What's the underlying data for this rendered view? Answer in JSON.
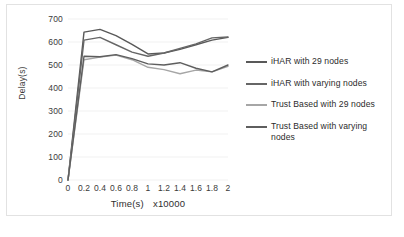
{
  "chart_data": {
    "type": "line",
    "title": "",
    "xlabel": "Time(s)",
    "xunit": "x10000",
    "ylabel": "Delay(s)",
    "xlim": [
      0,
      2
    ],
    "ylim": [
      0,
      700
    ],
    "grid": true,
    "legend_position": "right",
    "x": [
      0,
      0.2,
      0.4,
      0.6,
      0.8,
      1,
      1.2,
      1.4,
      1.6,
      1.8,
      2
    ],
    "xticklabels": [
      "0",
      "0.2",
      "0.4",
      "0.6",
      "0.8",
      "1",
      "1.2",
      "1.4",
      "1.6",
      "1.8",
      "2"
    ],
    "yticklabels": [
      "0",
      "100",
      "200",
      "300",
      "400",
      "500",
      "600",
      "700"
    ],
    "yticks": [
      0,
      100,
      200,
      300,
      400,
      500,
      600,
      700
    ],
    "series": [
      {
        "name": "iHAR with 29 nodes",
        "color": "#595959",
        "values": [
          0,
          643,
          655,
          628,
          590,
          548,
          552,
          568,
          588,
          608,
          620
        ]
      },
      {
        "name": "iHAR with varying nodes",
        "color": "#666666",
        "values": [
          0,
          608,
          620,
          588,
          556,
          538,
          552,
          572,
          592,
          618,
          622
        ]
      },
      {
        "name": "Trust Based with 29 nodes",
        "color": "#a6a6a6",
        "values": [
          0,
          523,
          534,
          543,
          523,
          490,
          480,
          462,
          478,
          470,
          494
        ]
      },
      {
        "name": "Trust Based with varying nodes",
        "color": "#5e5e5e",
        "values": [
          0,
          538,
          536,
          545,
          528,
          505,
          500,
          510,
          486,
          470,
          500
        ]
      }
    ]
  }
}
